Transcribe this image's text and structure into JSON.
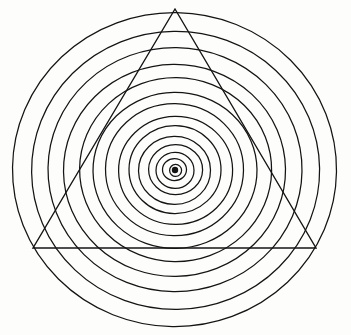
{
  "figure": {
    "background_color": "#fdfdfc",
    "stroke_color": "#141414",
    "width": 351,
    "height": 335
  },
  "chart_data": {
    "type": "scatter",
    "subtitle": "",
    "xlabel": "",
    "ylabel": "",
    "xlim": [
      0,
      351
    ],
    "ylim": [
      0,
      335
    ],
    "grid": false,
    "legend": "none",
    "center": {
      "x": 175,
      "y": 170
    },
    "ring_count": 13,
    "rings": [
      {
        "index": 1,
        "rx": 6,
        "ry": 6
      },
      {
        "index": 2,
        "rx": 12,
        "ry": 11
      },
      {
        "index": 3,
        "rx": 19,
        "ry": 18
      },
      {
        "index": 4,
        "rx": 27,
        "ry": 25
      },
      {
        "index": 5,
        "rx": 36,
        "ry": 34
      },
      {
        "index": 6,
        "rx": 46,
        "ry": 44
      },
      {
        "index": 7,
        "rx": 57,
        "ry": 54
      },
      {
        "index": 8,
        "rx": 69,
        "ry": 66
      },
      {
        "index": 9,
        "rx": 82,
        "ry": 78
      },
      {
        "index": 10,
        "rx": 96,
        "ry": 92
      },
      {
        "index": 11,
        "rx": 111,
        "ry": 106
      },
      {
        "index": 12,
        "rx": 127,
        "ry": 122
      },
      {
        "index": 13,
        "rx": 144,
        "ry": 139
      },
      {
        "index": 14,
        "rx": 162,
        "ry": 157
      }
    ],
    "center_dot": {
      "x": 175,
      "y": 170,
      "r": 3.2
    },
    "triangle": {
      "shape": "equilateral",
      "orientation": "apex-up",
      "vertices": [
        {
          "label": "apex",
          "x": 175,
          "y": 9
        },
        {
          "label": "bottom-left",
          "x": 33,
          "y": 248
        },
        {
          "label": "bottom-right",
          "x": 316,
          "y": 248
        }
      ]
    },
    "annotations": []
  }
}
